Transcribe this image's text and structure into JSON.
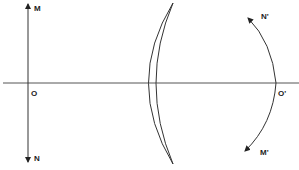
{
  "figure": {
    "type": "optics-diagram",
    "labels": {
      "object_top": "M",
      "object_bottom": "N",
      "object_axis_point": "O",
      "image_top": "N'",
      "image_bottom": "M'",
      "image_axis_point": "O'"
    },
    "colors": {
      "stroke": "#333333",
      "axis": "#555555",
      "text": "#222222"
    }
  }
}
